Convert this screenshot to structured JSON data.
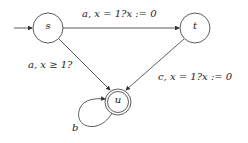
{
  "diagram": {
    "type": "timed-automaton",
    "states": [
      {
        "id": "s",
        "label": "s",
        "initial": true,
        "accepting": false
      },
      {
        "id": "t",
        "label": "t",
        "initial": false,
        "accepting": false
      },
      {
        "id": "u",
        "label": "u",
        "initial": false,
        "accepting": true
      }
    ],
    "transitions": [
      {
        "from": "s",
        "to": "t",
        "label": "a, x = 1?x := 0"
      },
      {
        "from": "s",
        "to": "u",
        "label": "a, x ≥ 1?"
      },
      {
        "from": "t",
        "to": "u",
        "label": "c, x = 1?x := 0"
      },
      {
        "from": "u",
        "to": "u",
        "label": "b"
      }
    ]
  }
}
